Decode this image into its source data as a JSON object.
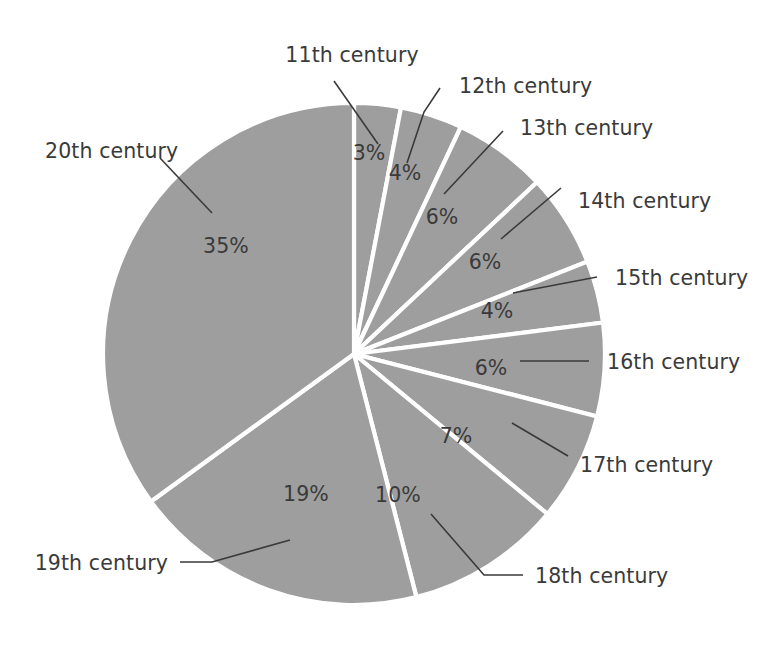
{
  "chart_data": {
    "type": "pie",
    "title": "",
    "subtitle": "",
    "xlabel": "",
    "ylabel": "",
    "legend_position": "none",
    "grid": false,
    "units": "%",
    "start_angle_deg": 0,
    "direction": "clockwise",
    "total": 100,
    "categories": [
      "11th century",
      "12th century",
      "13th century",
      "14th century",
      "15th century",
      "16th century",
      "17th century",
      "18th century",
      "19th century",
      "20th century"
    ],
    "values": [
      3,
      4,
      6,
      6,
      4,
      6,
      7,
      10,
      19,
      35
    ],
    "value_labels": [
      "3%",
      "4%",
      "6%",
      "6%",
      "4%",
      "6%",
      "7%",
      "10%",
      "19%",
      "35%"
    ],
    "slices": [
      {
        "label": "11th century",
        "value": 3,
        "value_label": "3%",
        "color": "#9e9e9e"
      },
      {
        "label": "12th century",
        "value": 4,
        "value_label": "4%",
        "color": "#9e9e9e"
      },
      {
        "label": "13th century",
        "value": 6,
        "value_label": "6%",
        "color": "#9e9e9e"
      },
      {
        "label": "14th century",
        "value": 6,
        "value_label": "6%",
        "color": "#9e9e9e"
      },
      {
        "label": "15th century",
        "value": 4,
        "value_label": "4%",
        "color": "#9e9e9e"
      },
      {
        "label": "16th century",
        "value": 6,
        "value_label": "6%",
        "color": "#9e9e9e"
      },
      {
        "label": "17th century",
        "value": 7,
        "value_label": "7%",
        "color": "#9e9e9e"
      },
      {
        "label": "18th century",
        "value": 10,
        "value_label": "10%",
        "color": "#9e9e9e"
      },
      {
        "label": "19th century",
        "value": 19,
        "value_label": "19%",
        "color": "#9e9e9e"
      },
      {
        "label": "20th century",
        "value": 35,
        "value_label": "35%",
        "color": "#9e9e9e"
      }
    ]
  },
  "colors": {
    "slice_fill": "#9e9e9e",
    "slice_separator": "#ffffff",
    "text": "#3a3a3a",
    "background": "#ffffff",
    "leader_line": "#3a3a3a"
  },
  "labels": {
    "c11": "11th century",
    "c12": "12th century",
    "c13": "13th century",
    "c14": "14th century",
    "c15": "15th century",
    "c16": "16th century",
    "c17": "17th century",
    "c18": "18th century",
    "c19": "19th century",
    "c20": "20th century"
  },
  "percents": {
    "c11": "3%",
    "c12": "4%",
    "c13": "6%",
    "c14": "6%",
    "c15": "4%",
    "c16": "6%",
    "c17": "7%",
    "c18": "10%",
    "c19": "19%",
    "c20": "35%"
  }
}
